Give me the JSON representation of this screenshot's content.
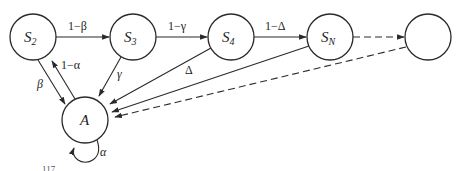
{
  "diagram": {
    "nodes": [
      {
        "id": "S2",
        "label": "S",
        "sub": "2",
        "cx": 33,
        "cy": 37
      },
      {
        "id": "S3",
        "label": "S",
        "sub": "3",
        "cx": 133,
        "cy": 37
      },
      {
        "id": "S4",
        "label": "S",
        "sub": "4",
        "cx": 231,
        "cy": 37
      },
      {
        "id": "SN",
        "label": "S",
        "sub": "N",
        "cx": 330,
        "cy": 37
      },
      {
        "id": "next",
        "label": "",
        "sub": "",
        "cx": 428,
        "cy": 37
      },
      {
        "id": "A",
        "label": "A",
        "sub": "",
        "cx": 85,
        "cy": 120
      }
    ],
    "edges": {
      "s2_s3": "1−β",
      "s3_s4": "1−γ",
      "s4_sn": "1−Δ",
      "a_s2": "1−α",
      "s2_a": "β",
      "s3_a": "γ",
      "s4_a": "Δ",
      "a_a": "α"
    },
    "caption": "117"
  }
}
